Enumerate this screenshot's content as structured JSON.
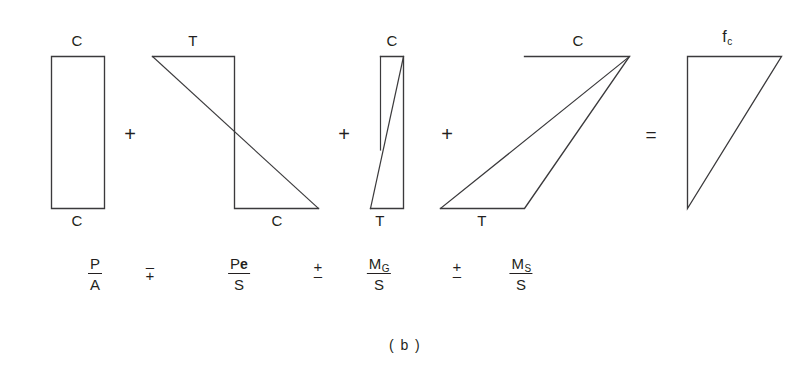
{
  "figure": {
    "caption": "( b )",
    "stroke_color": "#3b3a3c",
    "text_color": "#231f20",
    "background": "#ffffff"
  },
  "diagram": {
    "terms": [
      {
        "id": "axial",
        "shape": "rectangle",
        "top_label": "C",
        "bottom_label": "C",
        "formula": {
          "numerator": "P",
          "numerator_sub": "",
          "denominator": "A"
        }
      },
      {
        "id": "prestress-eccentric",
        "shape": "bowtie-left",
        "top_label": "T",
        "bottom_label": "C",
        "formula": {
          "numerator": "P",
          "numerator_sym": "e",
          "denominator": "S"
        }
      },
      {
        "id": "girder-moment",
        "shape": "bowtie-narrow",
        "top_label": "C",
        "bottom_label": "T",
        "formula": {
          "numerator": "M",
          "numerator_sub": "G",
          "denominator": "S"
        }
      },
      {
        "id": "superimposed-moment",
        "shape": "bowtie-right",
        "top_label": "C",
        "bottom_label": "T",
        "formula": {
          "numerator": "M",
          "numerator_sub": "S",
          "denominator": "S"
        }
      },
      {
        "id": "resultant",
        "shape": "triangle",
        "top_label": "f",
        "top_label_sub": "c",
        "bottom_label": "",
        "formula": null
      }
    ],
    "shape_operators": [
      "+",
      "+",
      "+",
      "="
    ],
    "formula_operators": [
      {
        "top": "–",
        "bottom": "+",
        "name": "minus-over-plus"
      },
      {
        "top": "+",
        "bottom": "–",
        "name": "plus-over-minus"
      },
      {
        "top": "+",
        "bottom": "–",
        "name": "plus-over-minus"
      }
    ]
  }
}
